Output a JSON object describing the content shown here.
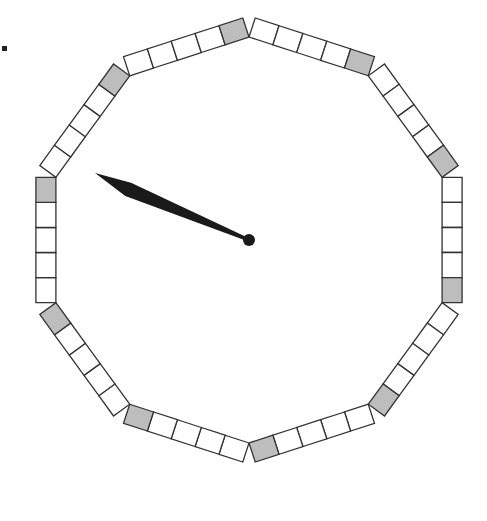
{
  "figure": {
    "center": [
      249,
      240
    ],
    "inner_radius": 203,
    "segments": 10,
    "boxes_per_segment": 5,
    "box_size": 20,
    "shaded_box_position": "clockwise-end",
    "colors": {
      "box_fill": "#ffffff",
      "shaded_fill": "#bdbdbd",
      "stroke": "#333333",
      "hand": "#1a1a1a"
    },
    "hand": {
      "tip": [
        95,
        173
      ],
      "pivot": [
        249,
        240
      ]
    },
    "marker_dot": [
      4,
      48
    ]
  }
}
